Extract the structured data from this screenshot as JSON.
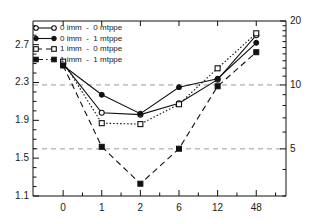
{
  "chart_data": {
    "type": "line",
    "title": "",
    "xlabel": "",
    "ylabel": "",
    "categories": [
      "0",
      "1",
      "2",
      "6",
      "12",
      "48"
    ],
    "xtick_labels": [
      "0",
      "1",
      "2",
      "6",
      "12",
      "48"
    ],
    "left_axis": {
      "tick_labels": [
        "1.1",
        "1.5",
        "1.9",
        "2.3",
        "2.7"
      ],
      "tick_values": [
        1.1,
        1.5,
        1.9,
        2.3,
        2.7
      ],
      "ylim": [
        1.1,
        2.95
      ],
      "scale": "linear",
      "minor_ticks": true
    },
    "right_axis": {
      "tick_labels": [
        "5",
        "10",
        "20"
      ],
      "tick_values": [
        5,
        10,
        20
      ],
      "ylim": [
        3.0,
        20.0
      ],
      "scale": "log",
      "minor_ticks": true
    },
    "grid": {
      "horizontal": true,
      "style": "dashed",
      "at_right_values": [
        5,
        10
      ],
      "color": "#9a9a9a"
    },
    "legend": {
      "position": "top-left",
      "entries": [
        {
          "label": "0 imm  -  0 mtppe",
          "marker": "open-circle",
          "line": "solid"
        },
        {
          "label": "0 imm  -  1 mtppe",
          "marker": "filled-circle",
          "line": "solid"
        },
        {
          "label": "1 imm  -  0 mtppe",
          "marker": "open-square",
          "line": "dashed"
        },
        {
          "label": "1 imm  -  1 mtppe",
          "marker": "filled-square",
          "line": "dash-dot"
        }
      ]
    },
    "series": [
      {
        "name": "0 imm  -  0 mtppe",
        "marker": "open-circle",
        "line": "solid",
        "color": "#111111",
        "values": [
          2.5,
          1.98,
          1.96,
          2.08,
          2.33,
          2.8
        ]
      },
      {
        "name": "0 imm  -  1 mtppe",
        "marker": "filled-circle",
        "line": "solid",
        "color": "#111111",
        "values": [
          2.48,
          2.17,
          1.97,
          2.25,
          2.34,
          2.72
        ]
      },
      {
        "name": "1 imm  -  0 mtppe",
        "marker": "open-square",
        "line": "dotted",
        "color": "#111111",
        "values": [
          2.52,
          1.87,
          1.86,
          2.07,
          2.45,
          2.82
        ]
      },
      {
        "name": "1 imm  -  1 mtppe",
        "marker": "filled-square",
        "line": "dashed",
        "color": "#111111",
        "values": [
          2.48,
          1.62,
          1.23,
          1.6,
          2.26,
          2.62
        ]
      }
    ]
  }
}
